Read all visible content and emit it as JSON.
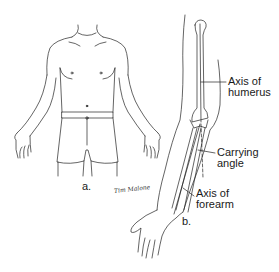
{
  "figure": {
    "panel_a": {
      "label": "a.",
      "subject": "anterior view of male torso with arms at sides, palms forward"
    },
    "panel_b": {
      "label": "b.",
      "subject": "extended arm showing humerus and forearm bones"
    },
    "annotations": [
      {
        "id": "axis-humerus",
        "line1": "Axis of",
        "line2": "humerus"
      },
      {
        "id": "carrying-angle",
        "line1": "Carrying",
        "line2": "angle"
      },
      {
        "id": "axis-forearm",
        "line1": "Axis of",
        "line2": "forearm"
      }
    ],
    "signature": "Tim Malone"
  },
  "colors": {
    "line": "#222222",
    "background": "#ffffff"
  }
}
